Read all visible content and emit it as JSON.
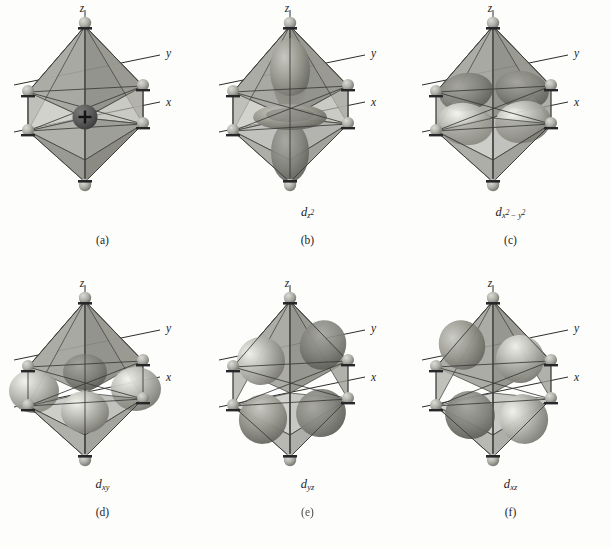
{
  "figure": {
    "background_color": "#fdfdfc",
    "columns": 3,
    "rows": 2
  },
  "style": {
    "octahedron_face_light": "#b9b9b4",
    "octahedron_face_mid": "#9e9e99",
    "octahedron_face_dark": "#86867f",
    "octahedron_face_darkest": "#74746d",
    "octahedron_edge": "#3a3a37",
    "ligand_sphere": "#b2b2ac",
    "ligand_sphere_dark": "#7d7d77",
    "metal_sphere": "#59595a",
    "axis_line": "#2d2d2b",
    "orbital_lobe": "#9a9a95",
    "orbital_lobe_light": "#e8e8e3",
    "orbital_lobe_dark": "#6f6f69",
    "text_color": "#1b1b1b"
  },
  "axes": {
    "z_label": "z",
    "y_label": "y",
    "x_label": "x"
  },
  "metal_center": {
    "charge_symbol": "+"
  },
  "panels": [
    {
      "id": "a",
      "caption": "(a)",
      "orbital_label": null,
      "orbital_base": null,
      "orbital_sub": null,
      "description": "octahedral-complex-metal-cation-six-ligands",
      "shows_metal_center": true,
      "orbital_type": "none"
    },
    {
      "id": "b",
      "caption": "(b)",
      "orbital_label": "dz2",
      "orbital_base": "d",
      "orbital_sub": "z",
      "orbital_sub_sup": "2",
      "description": "dz2-orbital-lobes-along-z-axis-with-torus",
      "shows_metal_center": false,
      "orbital_type": "dz2"
    },
    {
      "id": "c",
      "caption": "(c)",
      "orbital_label": "dx2-y2",
      "orbital_base": "d",
      "orbital_sub_x": "x",
      "orbital_sub_x_sup": "2",
      "orbital_sub_operator": "−",
      "orbital_sub_y": "y",
      "orbital_sub_y_sup": "2",
      "description": "dx2-y2-orbital-four-lobes-along-x-and-y-axes",
      "shows_metal_center": false,
      "orbital_type": "dx2y2"
    },
    {
      "id": "d",
      "caption": "(d)",
      "orbital_label": "dxy",
      "orbital_base": "d",
      "orbital_sub": "xy",
      "description": "dxy-orbital-four-lobes-between-x-and-y-axes",
      "shows_metal_center": false,
      "orbital_type": "dxy"
    },
    {
      "id": "e",
      "caption": "(e)",
      "caption_degraded": true,
      "orbital_label": "dyz",
      "orbital_base": "d",
      "orbital_sub": "yz",
      "description": "dyz-orbital-four-lobes-between-y-and-z-axes",
      "shows_metal_center": false,
      "orbital_type": "dyz"
    },
    {
      "id": "f",
      "caption": "(f)",
      "orbital_label": "dxz",
      "orbital_base": "d",
      "orbital_sub": "xz",
      "description": "dxz-orbital-four-lobes-between-x-and-z-axes",
      "shows_metal_center": false,
      "orbital_type": "dxz"
    }
  ]
}
